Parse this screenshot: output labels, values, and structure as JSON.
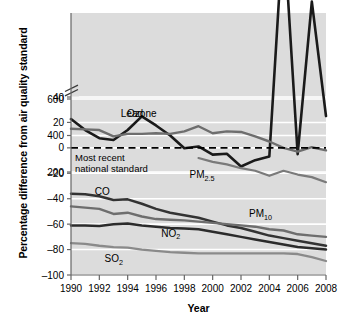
{
  "chart_data": {
    "type": "line",
    "title": "",
    "xlabel": "Year",
    "ylabel": "Percentage difference from air quality standard",
    "xlim": [
      1990,
      2008
    ],
    "xticks": [
      1990,
      1992,
      1994,
      1996,
      1998,
      2000,
      2002,
      2004,
      2006,
      2008
    ],
    "xtick_labels": [
      "1990",
      "1992",
      "1994",
      "1996",
      "1998",
      "2000",
      "2002",
      "2004",
      "2006",
      "2008"
    ],
    "yticks": [
      600,
      400,
      200,
      40,
      20,
      0,
      -20,
      -40,
      -60,
      -80,
      -100
    ],
    "ytick_labels": [
      "600",
      "400",
      "200",
      "40",
      "20",
      "0",
      "–20",
      "–40",
      "–60",
      "–80",
      "–100"
    ],
    "axis_break": {
      "present": true,
      "between": [
        200,
        40
      ],
      "style": "double-slash"
    },
    "grid": {
      "x": false,
      "y": true,
      "color": "#ffffff"
    },
    "plot_background": "#dcdcdc",
    "legend": {
      "position": "inline-labels"
    },
    "reference_line": {
      "value": 0,
      "style": "dashed",
      "color": "#000000",
      "annotation": "Most recent\nnational standard",
      "annotation_line1": "Most recent",
      "annotation_line2": "national standard"
    },
    "x": [
      1990,
      1991,
      1992,
      1993,
      1994,
      1995,
      1996,
      1997,
      1998,
      1999,
      2000,
      2001,
      2002,
      2003,
      2004,
      2005,
      2006,
      2007,
      2008
    ],
    "series": [
      {
        "name": "Lead",
        "label": "Lead",
        "color": "#1a1a1a",
        "width": 2.6,
        "label_x": 1994.3,
        "label_y": 520,
        "values": [
          490,
          430,
          385,
          375,
          430,
          505,
          455,
          400,
          330,
          340,
          295,
          300,
          230,
          265,
          285,
          175,
          -5,
          115,
          25
        ]
      },
      {
        "name": "Ozone",
        "label": "Ozone",
        "color": "#6e6e6e",
        "width": 2.4,
        "label_x": 1995.0,
        "label_y": 27,
        "values": [
          15,
          14.5,
          14,
          9,
          11,
          11,
          11.5,
          11,
          13,
          17,
          11.5,
          13,
          12.5,
          9,
          5,
          0,
          -3,
          0.5,
          -2
        ]
      },
      {
        "name": "PM2.5",
        "label": "PM",
        "label_sub": "2.5",
        "color": "#7a7a7a",
        "width": 2.2,
        "label_x": 1999.0,
        "label_y": -21,
        "start_index": 9,
        "values": [
          null,
          null,
          null,
          null,
          null,
          null,
          null,
          null,
          null,
          -8,
          -11,
          -13,
          -16,
          -18,
          -22,
          -18,
          -21,
          -23,
          -27
        ]
      },
      {
        "name": "CO",
        "label": "CO",
        "color": "#333333",
        "width": 2.5,
        "label_x": 1992.2,
        "label_y": -34,
        "values": [
          -36,
          -36.5,
          -38,
          -41,
          -40.5,
          -44,
          -48,
          -51,
          -53,
          -55,
          -58,
          -61,
          -63,
          -66,
          -69,
          -71,
          -73,
          -75,
          -77
        ]
      },
      {
        "name": "PM10",
        "label": "PM",
        "label_sub": "10",
        "color": "#6e6e6e",
        "width": 2.4,
        "label_x": 2003.2,
        "label_y": -52,
        "values": [
          -46,
          -47,
          -48,
          -52,
          -51,
          -54,
          -56,
          -56.5,
          -57,
          -58,
          -59,
          -60,
          -61,
          -62,
          -64,
          -65,
          -68,
          -69,
          -70
        ]
      },
      {
        "name": "NO2",
        "label": "NO",
        "label_sub": "2",
        "color": "#2b2b2b",
        "width": 2.5,
        "label_x": 1997.0,
        "label_y": -67,
        "values": [
          -61,
          -61,
          -61.5,
          -60,
          -59.5,
          -61,
          -62,
          -63,
          -63.5,
          -64,
          -66,
          -68,
          -70,
          -72,
          -74,
          -76,
          -78,
          -79,
          -80
        ]
      },
      {
        "name": "SO2",
        "label": "SO",
        "label_sub": "2",
        "color": "#8a8a8a",
        "width": 2.3,
        "label_x": 1993.0,
        "label_y": -87,
        "values": [
          -75,
          -75.5,
          -77,
          -78,
          -78.5,
          -80,
          -81,
          -82,
          -82.5,
          -83,
          -83,
          -83,
          -83,
          -83,
          -83,
          -83,
          -83.5,
          -86,
          -89
        ]
      }
    ]
  }
}
